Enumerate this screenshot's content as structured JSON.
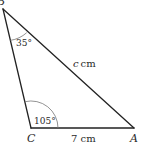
{
  "diagram": {
    "type": "triangle",
    "colors": {
      "stroke": "#222222",
      "arc": "#777777",
      "text": "#2a2a2a",
      "background": "#ffffff"
    },
    "vertices": {
      "B": {
        "label": "B"
      },
      "C": {
        "label": "C"
      },
      "A": {
        "label": "A"
      }
    },
    "angles": {
      "B": {
        "label": "35°"
      },
      "C": {
        "label": "105°"
      }
    },
    "sides": {
      "BA": {
        "variable": "c",
        "unit": "cm"
      },
      "CA": {
        "label": "7 cm"
      }
    }
  }
}
